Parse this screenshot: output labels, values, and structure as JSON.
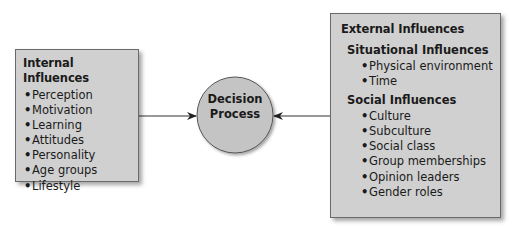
{
  "diagram": {
    "internal": {
      "title": "Internal Influences",
      "items": [
        "Perception",
        "Motivation",
        "Learning",
        "Attitudes",
        "Personality",
        "Age groups",
        "Lifestyle"
      ]
    },
    "center": {
      "line1": "Decision",
      "line2": "Process"
    },
    "external": {
      "title": "External Influences",
      "situational": {
        "title": "Situational Influences",
        "items": [
          "Physical environment",
          "Time"
        ]
      },
      "social": {
        "title": "Social Influences",
        "items": [
          "Culture",
          "Subculture",
          "Social class",
          "Group memberships",
          "Opinion leaders",
          "Gender roles"
        ]
      }
    },
    "colors": {
      "box_fill": "#d0d0d0",
      "circle_fill": "#c4c4c4",
      "line": "#333333"
    }
  }
}
